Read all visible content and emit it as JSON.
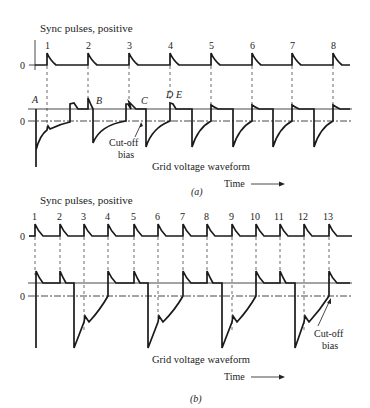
{
  "panel_a": {
    "sync_title": "Sync pulses, positive",
    "zero_label": "0",
    "pulse_numbers": [
      "1",
      "2",
      "3",
      "4",
      "5",
      "6",
      "7",
      "8"
    ],
    "point_labels": {
      "A": "A",
      "B": "B",
      "C": "C",
      "D": "D",
      "E": "E"
    },
    "cutoff_label_line1": "Cut-off",
    "cutoff_label_line2": "bias",
    "waveform_title": "Grid voltage waveform",
    "time_label": "Time",
    "caption": "(a)"
  },
  "panel_b": {
    "sync_title": "Sync pulses, positive",
    "zero_label": "0",
    "pulse_numbers": [
      "1",
      "2",
      "3",
      "4",
      "5",
      "6",
      "7",
      "8",
      "9",
      "10",
      "11",
      "12",
      "13"
    ],
    "cutoff_label_line1": "Cut-off",
    "cutoff_label_line2": "bias",
    "waveform_title": "Grid voltage waveform",
    "time_label": "Time",
    "caption": "(b)"
  }
}
